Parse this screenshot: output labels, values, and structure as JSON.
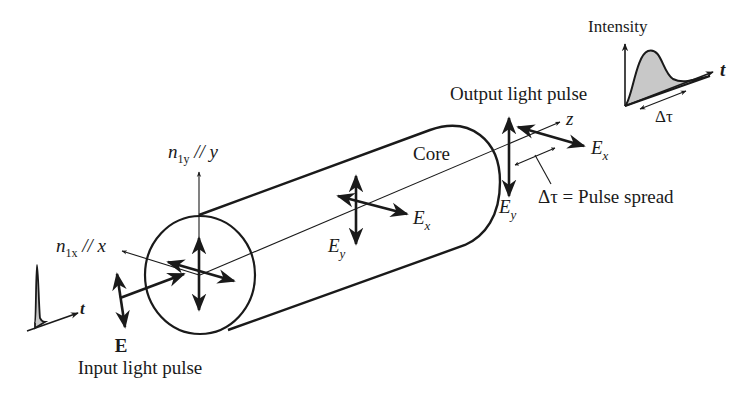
{
  "labels": {
    "intensity": "Intensity",
    "t_right": "t",
    "delta_tau": "Δτ",
    "output_pulse": "Output light pulse",
    "z": "z",
    "ex_right": "E",
    "ex_right_sub": "x",
    "ey_right": "E",
    "ey_right_sub": "y",
    "pulse_spread": "Δτ = Pulse spread",
    "core": "Core",
    "ex_mid": "E",
    "ex_mid_sub": "x",
    "ey_mid": "E",
    "ey_mid_sub": "y",
    "n1y_n": "n",
    "n1y_sub": "1y",
    "n1y_rest": " // y",
    "n1x_n": "n",
    "n1x_sub": "1x",
    "n1x_rest": " // x",
    "t_left": "t",
    "E_input": "E",
    "input_pulse": "Input light pulse"
  },
  "colors": {
    "ink": "#1a1a1a",
    "pulse_fill": "#c8c8c8"
  }
}
